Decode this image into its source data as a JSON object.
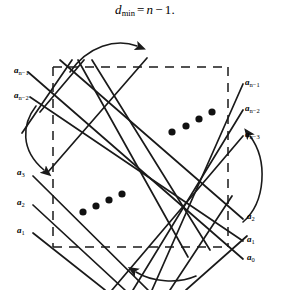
{
  "figure": {
    "formula": {
      "symbol": "d",
      "subscript": "min",
      "equals": "=",
      "expression_var": "n",
      "minus": "−",
      "value": "1",
      "period": ".",
      "full_text": "d_min = n − 1."
    },
    "colors": {
      "line": "#1a1a1a",
      "background": "#ffffff",
      "text": "#000000"
    },
    "left_labels": [
      {
        "base": "a",
        "sub": "n−1",
        "x": 14,
        "y": 72
      },
      {
        "base": "a",
        "sub": "n−2",
        "x": 14,
        "y": 97
      },
      {
        "base": "a",
        "sub": "3",
        "x": 17,
        "y": 174
      },
      {
        "base": "a",
        "sub": "2",
        "x": 17,
        "y": 204
      },
      {
        "base": "a",
        "sub": "1",
        "x": 17,
        "y": 232
      }
    ],
    "right_labels": [
      {
        "base": "a",
        "sub": "n−1",
        "x": 245,
        "y": 84
      },
      {
        "base": "a",
        "sub": "n−2",
        "x": 245,
        "y": 110
      },
      {
        "base": "a",
        "sub": "n−3",
        "x": 245,
        "y": 136
      },
      {
        "base": "a",
        "sub": "2",
        "x": 247,
        "y": 218
      },
      {
        "base": "a",
        "sub": "1",
        "x": 247,
        "y": 241
      },
      {
        "base": "a",
        "sub": "0",
        "x": 247,
        "y": 259
      }
    ],
    "ellipsis_upper_right": {
      "count": 4,
      "note": "diagonal dots ascending to the right"
    },
    "ellipsis_lower_left": {
      "count": 4,
      "note": "diagonal dots ascending to the right"
    },
    "arrows": [
      {
        "name": "top-curved-arrow",
        "direction": "up-right"
      },
      {
        "name": "left-curved-arrow",
        "direction": "down"
      },
      {
        "name": "right-curved-arrow",
        "direction": "up-left"
      },
      {
        "name": "bottom-curved-arrow",
        "direction": "left"
      }
    ]
  }
}
